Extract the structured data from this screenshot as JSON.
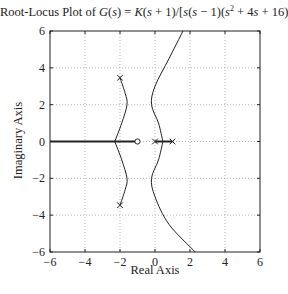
{
  "chart_data": {
    "type": "line",
    "title_parts": {
      "prefix": "Root-Locus Plot of ",
      "G": "G",
      "rest1": "(",
      "s1": "s",
      "rest2": ") = ",
      "K": "K",
      "rest3": "(",
      "s2": "s",
      "rest4": " + 1)/[",
      "s3": "s",
      "rest5": "(",
      "s4": "s",
      "rest6": " − 1)(",
      "s5": "s",
      "sup": "2",
      "rest7": " + 4",
      "s6": "s",
      "rest8": " + 16)]"
    },
    "xlabel": "Real Axis",
    "ylabel": "Imaginary Axis",
    "xlim": [
      -6,
      6
    ],
    "ylim": [
      -6,
      6
    ],
    "xticks": [
      "−6",
      "−4",
      "−2",
      "0",
      "2",
      "4",
      "6"
    ],
    "yticks": [
      "6",
      "4",
      "2",
      "0",
      "−2",
      "−4",
      "−6"
    ],
    "grid": true,
    "poles": [
      [
        0,
        0
      ],
      [
        1,
        0
      ],
      [
        -2,
        3.46
      ],
      [
        -2,
        -3.46
      ]
    ],
    "zeros": [
      [
        -1,
        0
      ]
    ],
    "series": [
      {
        "name": "branch-real-left",
        "x": [
          -6,
          -1
        ],
        "y": [
          0,
          0
        ]
      },
      {
        "name": "branch-real-right",
        "x": [
          0,
          1
        ],
        "y": [
          0,
          0
        ]
      },
      {
        "name": "branch-complex-upper",
        "x": [
          -2,
          -1.7,
          -1.6,
          -1.9,
          -2.3
        ],
        "y": [
          3.46,
          2.6,
          2.0,
          1.0,
          0
        ]
      },
      {
        "name": "branch-complex-lower",
        "x": [
          -2,
          -1.7,
          -1.6,
          -1.9,
          -2.3
        ],
        "y": [
          -3.46,
          -2.6,
          -2.0,
          -1.0,
          0
        ]
      },
      {
        "name": "branch-breakaway-upper",
        "x": [
          0.45,
          0.2,
          -0.2,
          0.0,
          0.8,
          1.6
        ],
        "y": [
          0,
          1.0,
          2.0,
          3.0,
          4.5,
          6.0
        ]
      },
      {
        "name": "branch-breakaway-lower",
        "x": [
          0.45,
          0.2,
          -0.2,
          0.0,
          0.8,
          2.3
        ],
        "y": [
          0,
          -1.0,
          -2.0,
          -3.0,
          -4.5,
          -6.0
        ]
      }
    ]
  }
}
